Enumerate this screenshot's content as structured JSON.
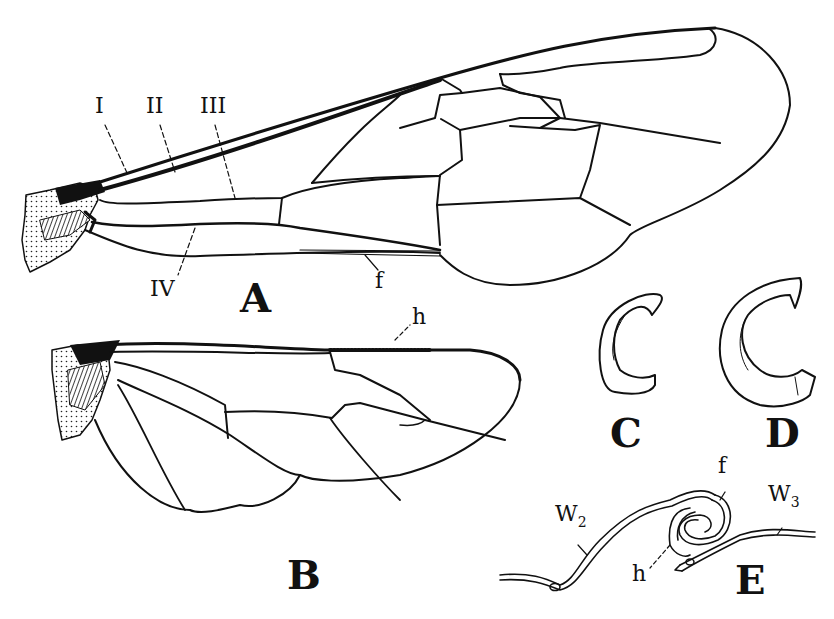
{
  "figure": {
    "panels": [
      {
        "id": "A",
        "label": "A",
        "description": "Forewing"
      },
      {
        "id": "B",
        "label": "B",
        "description": "Hindwing"
      },
      {
        "id": "C",
        "label": "C",
        "description": "Hook (hamulus), small"
      },
      {
        "id": "D",
        "label": "D",
        "description": "Hook (hamulus), large"
      },
      {
        "id": "E",
        "label": "E",
        "description": "Cross-section of wing coupling"
      }
    ],
    "forewing_labels": {
      "I": "I",
      "II": "II",
      "III": "III",
      "IV": "IV",
      "f": "f"
    },
    "hindwing_labels": {
      "h": "h"
    },
    "section_labels": {
      "f": "f",
      "h": "h",
      "W2_main": "W",
      "W2_sub": "2",
      "W3_main": "W",
      "W3_sub": "3"
    },
    "colors": {
      "ink": "#111111",
      "paper": "#ffffff",
      "stipple": "#e8e8e8"
    }
  }
}
